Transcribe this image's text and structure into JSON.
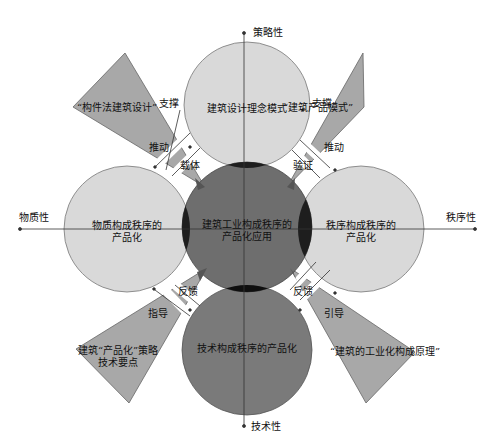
{
  "axes": {
    "top": "策略性",
    "bottom": "技术性",
    "left": "物质性",
    "right": "秩序性"
  },
  "circles": {
    "top": "建筑设计理念模式",
    "left_line1": "物质构成秩序的",
    "left_line2": "产品化",
    "right_line1": "秩序构成秩序的",
    "right_line2": "产品化",
    "bottom": "技术构成秩序的产品化",
    "center_line1": "建筑工业构成秩序的",
    "center_line2": "产品化应用"
  },
  "triangles": {
    "top_left": "“构件法建筑设计”",
    "top_right": "“建筑产品模式”",
    "bottom_left_line1": "建筑“产品化”策略",
    "bottom_left_line2": "技术要点",
    "bottom_right": "“建筑的工业化构成原理”"
  },
  "relations": {
    "tl_support": "支撑",
    "tl_drive": "推动",
    "tl_carrier": "载体",
    "tr_support": "支撑",
    "tr_drive": "推动",
    "tr_verify": "验证",
    "bl_feedback": "反馈",
    "bl_guide": "指导",
    "br_feedback": "反馈",
    "br_guide": "引导"
  },
  "colors": {
    "outer_circle": "#d9d9d9",
    "center_circle": "#6e6e6e",
    "bottom_circle": "#7a7a7a",
    "overlap": "#1e1e1e",
    "triangle": "#a8a8a8",
    "stroke": "#555555"
  }
}
